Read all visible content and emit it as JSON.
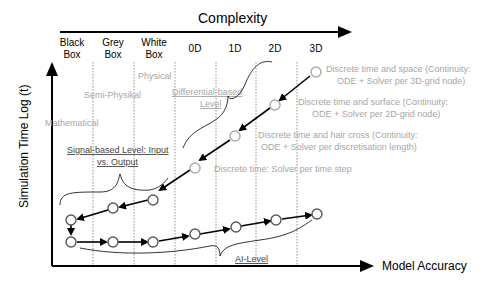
{
  "top_axis": {
    "title": "Complexity"
  },
  "columns": [
    {
      "line1": "Black",
      "line2": "Box"
    },
    {
      "line1": "Grey",
      "line2": "Box"
    },
    {
      "line1": "White",
      "line2": "Box"
    },
    {
      "line1": "0D",
      "line2": ""
    },
    {
      "line1": "1D",
      "line2": ""
    },
    {
      "line1": "2D",
      "line2": ""
    },
    {
      "line1": "3D",
      "line2": ""
    }
  ],
  "y_axis": {
    "label": "Simulation Time Log (t)"
  },
  "x_axis": {
    "label": "Model Accuracy"
  },
  "labels": {
    "physical": "Physical",
    "semi_physical": "Semi-Physikal",
    "mathematical": "Mathematical",
    "differential_line1": "Differential-based",
    "differential_line2": "Level",
    "signal_line1": "Signal-based Level: Input",
    "signal_line2": "vs. Output",
    "ai_level": "AI-Level",
    "d3_line1": "Discrete time and space (Continuity:",
    "d3_line2": "ODE + Solver per 3D-grid node)",
    "d2_line1": "Discrete time and surface (Continuity:",
    "d2_line2": "ODE + Solver per 2D-grid node)",
    "d1_line1": "Discrete time and hair cross (Continuity:",
    "d1_line2": "ODE + Solver per discretisation length)",
    "d0": "Discrete time: Solver per time step"
  },
  "colors": {
    "axis": "#000000",
    "muted_text": "#a6a6a6",
    "node_fill": "#ffffff",
    "node_stroke": "#595959"
  }
}
